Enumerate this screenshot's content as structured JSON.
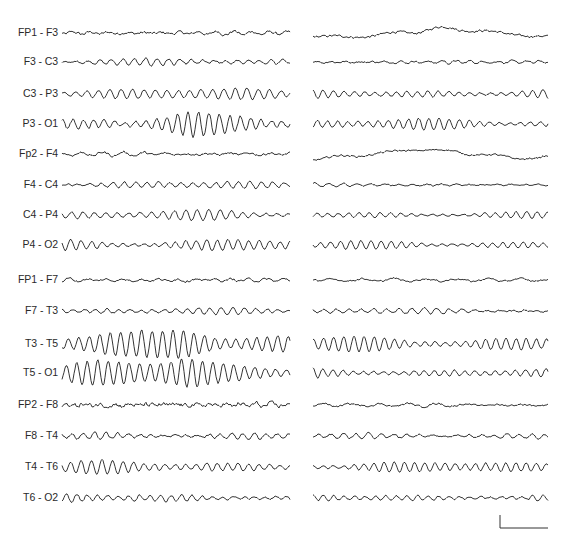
{
  "figure": {
    "type": "EEG montage (bipolar), two epochs side by side",
    "scale_bar": {
      "x": 500,
      "y_top": 515,
      "y_bottom": 528,
      "x_end": 548,
      "stroke": "#333333"
    }
  },
  "channels": [
    {
      "label": "FP1 - F3",
      "y": 33,
      "left": {
        "amp": 2.0,
        "freq": 0.35,
        "noise": 1.2
      },
      "right": {
        "amp": 2.5,
        "freq": 0.12,
        "noise": 1.0,
        "drift": 4
      }
    },
    {
      "label": "F3 - C3",
      "y": 62,
      "left": {
        "amp": 3.5,
        "freq": 0.55,
        "noise": 0.8
      },
      "right": {
        "amp": 1.8,
        "freq": 0.45,
        "noise": 0.8
      }
    },
    {
      "label": "C3 - P3",
      "y": 94,
      "left": {
        "amp": 6.5,
        "freq": 0.55,
        "noise": 0.6
      },
      "right": {
        "amp": 5.0,
        "freq": 0.6,
        "noise": 0.5
      }
    },
    {
      "label": "P3 - O1",
      "y": 124,
      "left": {
        "amp": 8.5,
        "freq": 0.6,
        "noise": 1.0,
        "burst": true
      },
      "right": {
        "amp": 6.0,
        "freq": 0.62,
        "noise": 0.5
      }
    },
    {
      "label": "Fp2 - F4",
      "y": 154,
      "left": {
        "amp": 2.0,
        "freq": 0.3,
        "noise": 1.0
      },
      "right": {
        "amp": 2.2,
        "freq": 0.12,
        "noise": 0.8,
        "drift": 4
      }
    },
    {
      "label": "F4 - C4",
      "y": 185,
      "left": {
        "amp": 4.0,
        "freq": 0.55,
        "noise": 0.7
      },
      "right": {
        "amp": 1.8,
        "freq": 0.45,
        "noise": 0.6
      }
    },
    {
      "label": "C4 - P4",
      "y": 215,
      "left": {
        "amp": 5.5,
        "freq": 0.55,
        "noise": 0.6
      },
      "right": {
        "amp": 3.5,
        "freq": 0.6,
        "noise": 0.4
      }
    },
    {
      "label": "P4 - O2",
      "y": 245,
      "left": {
        "amp": 6.5,
        "freq": 0.6,
        "noise": 0.6
      },
      "right": {
        "amp": 4.5,
        "freq": 0.62,
        "noise": 0.4
      }
    },
    {
      "label": "FP1 - F7",
      "y": 280,
      "left": {
        "amp": 2.0,
        "freq": 0.35,
        "noise": 1.0
      },
      "right": {
        "amp": 2.0,
        "freq": 0.2,
        "noise": 0.8
      }
    },
    {
      "label": "F7 - T3",
      "y": 311,
      "left": {
        "amp": 3.5,
        "freq": 0.55,
        "noise": 0.7
      },
      "right": {
        "amp": 3.0,
        "freq": 0.5,
        "noise": 0.7
      }
    },
    {
      "label": "T3 - T5",
      "y": 344,
      "left": {
        "amp": 13.0,
        "freq": 0.6,
        "noise": 0.8,
        "burst": true
      },
      "right": {
        "amp": 8.5,
        "freq": 0.62,
        "noise": 0.5
      }
    },
    {
      "label": "T5 - O1",
      "y": 373,
      "left": {
        "amp": 13.0,
        "freq": 0.6,
        "noise": 0.8,
        "burst": true
      },
      "right": {
        "amp": 5.0,
        "freq": 0.62,
        "noise": 0.6
      }
    },
    {
      "label": "FP2 - F8",
      "y": 405,
      "left": {
        "amp": 1.5,
        "freq": 0.4,
        "noise": 1.8
      },
      "right": {
        "amp": 2.0,
        "freq": 0.22,
        "noise": 0.8
      }
    },
    {
      "label": "F8 - T4",
      "y": 436,
      "left": {
        "amp": 3.5,
        "freq": 0.55,
        "noise": 0.9
      },
      "right": {
        "amp": 3.0,
        "freq": 0.5,
        "noise": 0.8
      }
    },
    {
      "label": "T4 - T6",
      "y": 467,
      "left": {
        "amp": 7.0,
        "freq": 0.6,
        "noise": 0.6
      },
      "right": {
        "amp": 6.0,
        "freq": 0.62,
        "noise": 0.5
      }
    },
    {
      "label": "T6 - O2",
      "y": 498,
      "left": {
        "amp": 4.5,
        "freq": 0.6,
        "noise": 0.8
      },
      "right": {
        "amp": 3.5,
        "freq": 0.6,
        "noise": 0.7
      }
    }
  ],
  "columns": {
    "left": {
      "x_start": 62,
      "x_end": 290
    },
    "right": {
      "x_start": 313,
      "x_end": 548
    }
  }
}
